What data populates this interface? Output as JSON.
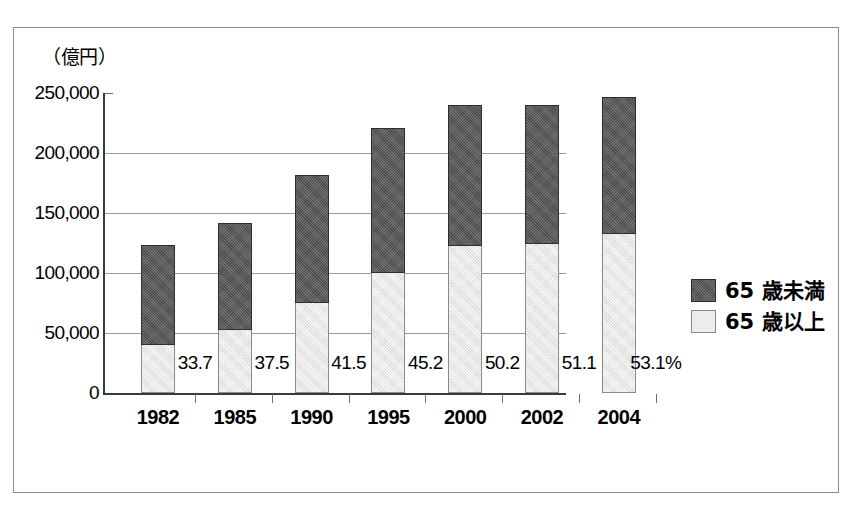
{
  "chart_data": {
    "type": "bar",
    "subtype": "stacked-vertical",
    "title": "",
    "unit_label": "（億円）",
    "xlabel": "",
    "ylabel": "",
    "categories": [
      "1982",
      "1985",
      "1990",
      "1995",
      "2000",
      "2002",
      "2004"
    ],
    "series": [
      {
        "name": "65 歳以上",
        "key": "age_65_and_over",
        "color": "#e6e6e6",
        "values": [
          41000,
          53000,
          76000,
          101000,
          123000,
          125000,
          133000
        ]
      },
      {
        "name": "65 歳未満",
        "key": "under_65",
        "color": "#595959",
        "values": [
          82000,
          89000,
          106000,
          120000,
          117000,
          115000,
          114000
        ]
      }
    ],
    "totals": [
      123000,
      142000,
      182000,
      221000,
      240000,
      240000,
      247000
    ],
    "share_labels": [
      "33.7",
      "37.5",
      "41.5",
      "45.2",
      "50.2",
      "51.1",
      "53.1%"
    ],
    "share_values": [
      33.7,
      37.5,
      41.5,
      45.2,
      50.2,
      51.1,
      53.1
    ],
    "yticks": [
      "0",
      "50,000",
      "100,000",
      "150,000",
      "200,000",
      "250,000"
    ],
    "ytick_values": [
      0,
      50000,
      100000,
      150000,
      200000,
      250000
    ],
    "ylim": [
      0,
      250000
    ],
    "grid": true,
    "gridlines_at": [
      50000,
      100000,
      150000,
      200000
    ],
    "legend_position": "right"
  },
  "legend": {
    "items": [
      {
        "label": "65 歳未満",
        "swatch": "dark"
      },
      {
        "label": "65 歳以上",
        "swatch": "light"
      }
    ]
  },
  "colors": {
    "dark_fill": "#595959",
    "light_fill": "#e6e6e6",
    "axis": "#3a3a3a",
    "grid": "#9a9a9a",
    "frame": "#8c8c8c",
    "background": "#ffffff"
  }
}
